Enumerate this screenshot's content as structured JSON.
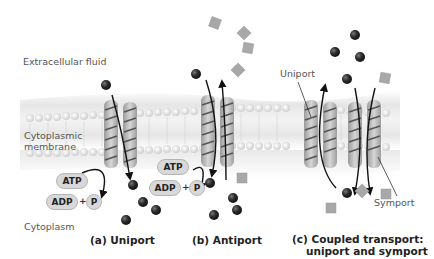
{
  "labels": {
    "extracellular": "Extracellular fluid",
    "membrane_line1": "Cytoplasmic",
    "membrane_line2": "membrane",
    "cytoplasm": "Cytoplasm",
    "uniport_pointer": "Uniport",
    "symport_pointer": "Symport"
  },
  "panels": {
    "a": {
      "caption": "(a) Uniport",
      "atp": "ATP",
      "adp": "ADP",
      "plus": "+",
      "p": "P"
    },
    "b": {
      "caption": "(b) Antiport",
      "atp": "ATP",
      "adp": "ADP",
      "plus": "+",
      "p": "P"
    },
    "c": {
      "caption_line1": "(c) Coupled transport:",
      "caption_line2": "uniport and symport"
    }
  },
  "colors": {
    "background": "#ffffff",
    "membrane": "#e3e3e3",
    "lipid_head": "#f2f2f2",
    "protein": "#c9c9c9",
    "protein_stripe": "#555555",
    "sphere": "#2a2a2a",
    "square": "#a8a8a8",
    "arrow": "#111111"
  }
}
